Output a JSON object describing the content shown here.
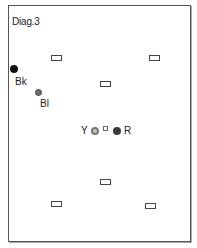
{
  "diagram": {
    "title": "Diag.3",
    "colors": {
      "frame": "#555555",
      "black_dot": "#111111",
      "blue_dot": "#6f6f6f",
      "yellow_dot_ring": "#777777",
      "yellow_dot_fill": "#c8c8c8",
      "red_dot": "#3a3a3a"
    },
    "markers": [
      {
        "id": "rect-top-left",
        "type": "rectangle",
        "x": 51,
        "y": 55
      },
      {
        "id": "rect-top-right",
        "type": "rectangle",
        "x": 149,
        "y": 55
      },
      {
        "id": "rect-upper-center",
        "type": "rectangle",
        "x": 100,
        "y": 81
      },
      {
        "id": "rect-lower-center",
        "type": "rectangle",
        "x": 100,
        "y": 179
      },
      {
        "id": "rect-bottom-left",
        "type": "rectangle",
        "x": 51,
        "y": 201
      },
      {
        "id": "rect-bottom-right",
        "type": "rectangle",
        "x": 145,
        "y": 203
      }
    ],
    "balls": [
      {
        "id": "bk",
        "label": "Bk",
        "name": "black ball",
        "cx": 14,
        "cy": 69,
        "d": 7
      },
      {
        "id": "bl",
        "label": "Bl",
        "name": "blue ball",
        "cx": 38,
        "cy": 92,
        "d": 6
      },
      {
        "id": "y",
        "label": "Y",
        "name": "yellow ball",
        "cx": 95,
        "cy": 131,
        "d": 7
      },
      {
        "id": "r",
        "label": "R",
        "name": "red ball",
        "cx": 117,
        "cy": 131,
        "d": 7
      }
    ],
    "center_spot": {
      "x": 104,
      "y": 127
    }
  }
}
